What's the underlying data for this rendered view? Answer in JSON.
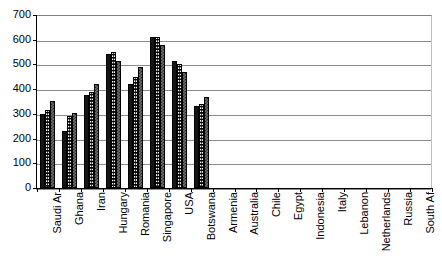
{
  "chart_data": {
    "type": "bar",
    "title": "",
    "subtitle": "",
    "xlabel": "",
    "ylabel": "",
    "ylim": [
      0,
      700
    ],
    "ytick_step": 100,
    "yticks": [
      0,
      100,
      200,
      300,
      400,
      500,
      600,
      700
    ],
    "grid": true,
    "legend": false,
    "legend_position": "none",
    "orientation": "vertical",
    "categories": [
      "Saudi Ar",
      "Ghana",
      "Iran",
      "Hungary",
      "Romania",
      "Singapore",
      "USA",
      "Botswana",
      "Armenia",
      "Australia",
      "Chile",
      "Egypt",
      "Indonesia",
      "Italy",
      "Lebanon",
      "Netherlands",
      "Russia",
      "South Af"
    ],
    "series": [
      {
        "name": "Series 1",
        "fill": "solid-black",
        "color": "#151515",
        "values": [
          300,
          230,
          375,
          543,
          422,
          612,
          512,
          332,
          null,
          null,
          null,
          null,
          null,
          null,
          null,
          null,
          null,
          null
        ]
      },
      {
        "name": "Series 2",
        "fill": "white-dotted",
        "color": "#ffffff",
        "values": [
          317,
          290,
          388,
          552,
          448,
          610,
          500,
          340,
          null,
          null,
          null,
          null,
          null,
          null,
          null,
          null,
          null,
          null
        ]
      },
      {
        "name": "Series 3",
        "fill": "gray-checker",
        "color": "#6e6e6e",
        "values": [
          352,
          305,
          420,
          512,
          490,
          578,
          468,
          370,
          null,
          null,
          null,
          null,
          null,
          null,
          null,
          null,
          null,
          null
        ]
      }
    ]
  },
  "colors": {
    "background": "#ffffff",
    "axis": "#000000",
    "gridline": "#8c8c8c",
    "series_1": "#151515",
    "series_2": "#ffffff",
    "series_3": "#6e6e6e"
  }
}
